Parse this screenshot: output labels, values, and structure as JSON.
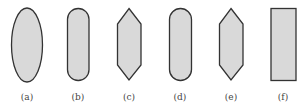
{
  "diagram": {
    "fill_color": "#d9d9d9",
    "stroke_color": "#333333",
    "shapes": [
      {
        "id": "a",
        "shape": "ellipse",
        "label": "(a)"
      },
      {
        "id": "b",
        "shape": "stadium",
        "label": "(b)"
      },
      {
        "id": "c",
        "shape": "elongated-hexagon",
        "label": "(c)"
      },
      {
        "id": "d",
        "shape": "stadium",
        "label": "(d)"
      },
      {
        "id": "e",
        "shape": "elongated-hexagon",
        "label": "(e)"
      },
      {
        "id": "f",
        "shape": "rectangle",
        "label": "(f)"
      }
    ]
  }
}
